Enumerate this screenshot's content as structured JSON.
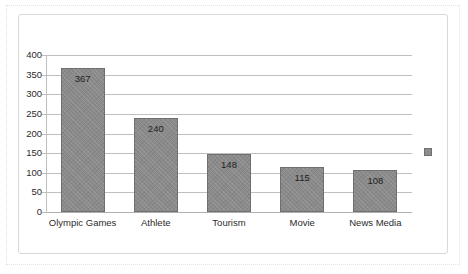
{
  "chart_data": {
    "type": "bar",
    "title": "",
    "subtitle": "",
    "xlabel": "",
    "ylabel": "",
    "categories": [
      "Olympic Games",
      "Athlete",
      "Tourism",
      "Movie",
      "News Media"
    ],
    "values": [
      367,
      240,
      148,
      115,
      108
    ],
    "value_labels": [
      "367",
      "240",
      "148",
      "115",
      "108"
    ],
    "ylim": [
      0,
      400
    ],
    "ytick_values": [
      0,
      50,
      100,
      150,
      200,
      250,
      300,
      350,
      400
    ],
    "ytick_labels": [
      "0",
      "50",
      "100",
      "150",
      "200",
      "250",
      "300",
      "350",
      "400"
    ],
    "grid": "horizontal",
    "legend": {
      "position": "right",
      "entries": [
        {
          "label": "",
          "color": "#8a8a8a"
        }
      ]
    },
    "series": [
      {
        "name": "",
        "color": "#8a8a8a",
        "values": [
          367,
          240,
          148,
          115,
          108
        ]
      }
    ]
  },
  "style": {
    "bar_color": "#8a8a8a",
    "bar_border_color": "#6f6f6f",
    "gridline_color": "#bfbfbf",
    "axis_color": "#bfbfbf",
    "text_color": "#2b2b2b",
    "frame_color": "#d9d9d9",
    "outer_frame_color": "#e2e2e2",
    "background": "#ffffff"
  }
}
